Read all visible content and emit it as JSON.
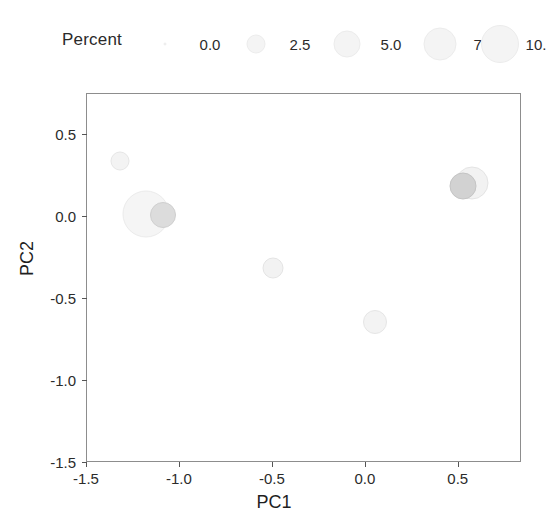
{
  "chart_data": {
    "type": "scatter",
    "title": "",
    "xlabel": "PC1",
    "ylabel": "PC2",
    "xlim": [
      -1.5,
      0.84
    ],
    "ylim": [
      -1.5,
      0.75
    ],
    "xticks": [
      "-1.5",
      "-1.0",
      "-0.5",
      "0.0",
      "0.5"
    ],
    "xtick_values": [
      -1.5,
      -1.0,
      -0.5,
      0.0,
      0.5
    ],
    "yticks": [
      "0.5",
      "0.0",
      "-0.5",
      "-1.0",
      "-1.5"
    ],
    "ytick_values": [
      0.5,
      0.0,
      -0.5,
      -1.0,
      -1.5
    ],
    "grid": false,
    "size_variable": "Percent",
    "legend": {
      "title": "Percent",
      "position": "top",
      "entries": [
        {
          "label": "0.0",
          "value": 0.0,
          "diameter_px": 3
        },
        {
          "label": "2.5",
          "value": 2.5,
          "diameter_px": 19
        },
        {
          "label": "5.0",
          "value": 5.0,
          "diameter_px": 27
        },
        {
          "label": "7.5",
          "value": 7.5,
          "diameter_px": 33
        },
        {
          "label": "10.",
          "value": 10.0,
          "diameter_px": 38
        }
      ]
    },
    "points": [
      {
        "x": -1.32,
        "y": 0.34,
        "size": 2.2,
        "diameter_px": 19,
        "fill": "#f3f3f3",
        "stroke": "#e6e6e6"
      },
      {
        "x": -1.18,
        "y": 0.02,
        "size": 8.4,
        "diameter_px": 47,
        "fill": "#f5f5f5",
        "stroke": "#ebebeb"
      },
      {
        "x": -1.09,
        "y": 0.01,
        "size": 4.0,
        "diameter_px": 26,
        "fill": "#dcdcdc",
        "stroke": "#cfcfcf"
      },
      {
        "x": -0.5,
        "y": -0.31,
        "size": 2.6,
        "diameter_px": 21,
        "fill": "#f2f2f2",
        "stroke": "#e4e4e4"
      },
      {
        "x": 0.05,
        "y": -0.64,
        "size": 3.2,
        "diameter_px": 24,
        "fill": "#f3f3f3",
        "stroke": "#e6e6e6"
      },
      {
        "x": 0.57,
        "y": 0.21,
        "size": 5.0,
        "diameter_px": 33,
        "fill": "#f2f2f2",
        "stroke": "#e4e4e4"
      },
      {
        "x": 0.52,
        "y": 0.19,
        "size": 3.8,
        "diameter_px": 27,
        "fill": "#d2d2d2",
        "stroke": "#c4c4c4"
      }
    ],
    "axis_color": "#8d8d8d",
    "tick_color": "#555555",
    "text_color": "#2b2b2b"
  }
}
